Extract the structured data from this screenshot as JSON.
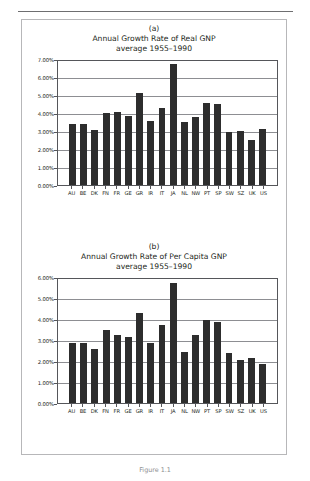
{
  "figure": {
    "caption": "Figure 1.1",
    "panels": [
      {
        "letter": "(a)",
        "title_line1": "Annual Growth Rate of Real GNP",
        "title_line2": "average 1955–1990"
      },
      {
        "letter": "(b)",
        "title_line1": "Annual Growth Rate of Per Capita GNP",
        "title_line2": "average 1955–1990"
      }
    ]
  },
  "chart_data": [
    {
      "type": "bar",
      "title": "Annual Growth Rate of Real GNP",
      "subtitle": "average 1955–1990",
      "panel_label": "(a)",
      "xlabel": "",
      "ylabel": "",
      "ylim": [
        0,
        7
      ],
      "yticks": [
        "0.00%",
        "1.00%",
        "2.00%",
        "3.00%",
        "4.00%",
        "5.00%",
        "6.00%",
        "7.00%"
      ],
      "ytick_values": [
        0,
        1,
        2,
        3,
        4,
        5,
        6,
        7
      ],
      "grid": true,
      "legend": "none",
      "categories": [
        "AU",
        "BE",
        "DK",
        "FN",
        "FR",
        "GE",
        "GR",
        "IR",
        "IT",
        "JA",
        "NL",
        "NW",
        "PT",
        "SP",
        "SW",
        "SZ",
        "UK",
        "US"
      ],
      "values": [
        3.37,
        3.38,
        3.07,
        3.99,
        4.08,
        3.84,
        5.1,
        3.56,
        4.27,
        6.73,
        3.48,
        3.76,
        4.56,
        4.52,
        2.96,
        3.01,
        2.53,
        3.12
      ],
      "bar_color": "#2d2d2d"
    },
    {
      "type": "bar",
      "title": "Annual Growth Rate of Per Capita GNP",
      "subtitle": "average 1955–1990",
      "panel_label": "(b)",
      "xlabel": "",
      "ylabel": "",
      "ylim": [
        0,
        6
      ],
      "yticks": [
        "0.00%",
        "1.00%",
        "2.00%",
        "3.00%",
        "4.00%",
        "5.00%",
        "6.00%"
      ],
      "ytick_values": [
        0,
        1,
        2,
        3,
        4,
        5,
        6
      ],
      "grid": true,
      "legend": "none",
      "categories": [
        "AU",
        "BE",
        "DK",
        "FN",
        "FR",
        "GE",
        "GR",
        "IR",
        "IT",
        "JA",
        "NL",
        "NW",
        "PT",
        "SP",
        "SW",
        "SZ",
        "UK",
        "US"
      ],
      "values": [
        2.87,
        2.84,
        2.58,
        3.47,
        3.22,
        3.16,
        4.3,
        2.87,
        3.7,
        5.74,
        2.45,
        3.26,
        3.95,
        3.85,
        2.38,
        2.06,
        2.15,
        1.84
      ],
      "bar_color": "#2d2d2d"
    }
  ]
}
